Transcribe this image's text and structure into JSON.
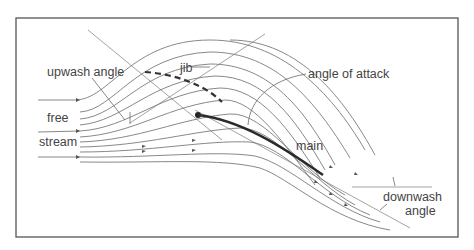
{
  "figure": {
    "colors": {
      "background": "#ffffff",
      "frame": "#555555",
      "streamline": "#7a7a7a",
      "main_sail": "#2a2a2a",
      "jib_sail": "#333333",
      "text": "#444444"
    }
  },
  "labels": {
    "upwash_angle": "upwash angle",
    "jib": "jib",
    "angle_of_attack": "angle of attack",
    "free": "free",
    "stream": "stream",
    "main": "main",
    "downwash": "downwash",
    "angle": "angle"
  },
  "elements": {
    "jib_sail": "dashed curve (jib)",
    "main_sail": "solid heavy curve (main)",
    "mast": "mast-dot"
  }
}
